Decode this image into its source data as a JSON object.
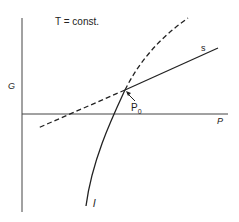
{
  "diagram": {
    "title": "T = const.",
    "axes": {
      "y_label": "G",
      "x_label": "P"
    },
    "curves": [
      {
        "id": "s",
        "label": "s",
        "style": "solid",
        "description": "solid phase line"
      },
      {
        "id": "l",
        "label": "l",
        "style": "solid",
        "description": "liquid phase curve"
      },
      {
        "id": "s-extension",
        "label": "",
        "style": "dashed"
      },
      {
        "id": "l-extension",
        "label": "",
        "style": "dashed"
      }
    ],
    "intersection": {
      "label_main": "P",
      "label_sub": "0"
    },
    "colors": {
      "line": "#222222",
      "background": "#ffffff"
    }
  }
}
